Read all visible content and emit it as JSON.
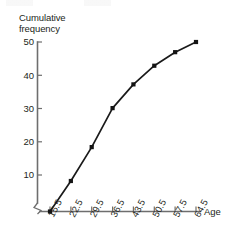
{
  "chart_data": {
    "type": "line",
    "title": "",
    "xlabel": "Age",
    "ylabel": "Cumulative\nfrequency",
    "x": [
      15.5,
      22.5,
      29.5,
      36.5,
      43.5,
      50.5,
      57.5,
      64.5
    ],
    "xtick_labels": [
      "15.5",
      "22.5",
      "29.5",
      "36.5",
      "43.5",
      "50.5",
      "57.5",
      "64.5"
    ],
    "values": [
      0,
      9,
      19,
      30.5,
      37.5,
      43,
      47,
      50
    ],
    "ytick_labels": [
      "10",
      "20",
      "30",
      "40",
      "50"
    ],
    "ytick_values": [
      10,
      20,
      30,
      40,
      50
    ],
    "xlim": [
      15.5,
      64.5
    ],
    "ylim": [
      0,
      50
    ],
    "grid": false,
    "legend": false,
    "marker": "filled-square",
    "axis_break_y": true,
    "axis_break_x": true,
    "line_color": "#1a1a1a",
    "axis_color": "#6e6e6e"
  }
}
